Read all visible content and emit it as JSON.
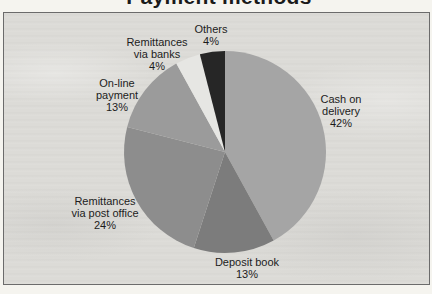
{
  "chart_data": {
    "type": "pie",
    "title": "Payment methods",
    "unit": "%",
    "direction": "clockwise",
    "start_angle": "12 o'clock",
    "legend": "none",
    "labels_layout": "outside slices, centered multi-line",
    "slices": [
      {
        "id": "cash-on-delivery",
        "label": "Cash on delivery",
        "value": 42,
        "percent_label": "42%",
        "label_lines": [
          "Cash on",
          "delivery",
          "42%"
        ],
        "color": "#a5a5a5",
        "label_pos": {
          "x": 341,
          "y": 93
        }
      },
      {
        "id": "deposit-book",
        "label": "Deposit book",
        "value": 13,
        "percent_label": "13%",
        "label_lines": [
          "Deposit book",
          "13%"
        ],
        "color": "#7c7c7c",
        "label_pos": {
          "x": 247,
          "y": 256
        }
      },
      {
        "id": "remittances-via-post-office",
        "label": "Remittances via post office",
        "value": 24,
        "percent_label": "24%",
        "label_lines": [
          "Remittances",
          "via post office",
          "24%"
        ],
        "color": "#8d8d8d",
        "label_pos": {
          "x": 105,
          "y": 195
        }
      },
      {
        "id": "on-line-payment",
        "label": "On-line payment",
        "value": 13,
        "percent_label": "13%",
        "label_lines": [
          "On-line",
          "payment",
          "13%"
        ],
        "color": "#9b9b9b",
        "label_pos": {
          "x": 117,
          "y": 77
        }
      },
      {
        "id": "remittances-via-banks",
        "label": "Remittances via banks",
        "value": 4,
        "percent_label": "4%",
        "label_lines": [
          "Remittances",
          "via banks",
          "4%"
        ],
        "color": "#e6e6e3",
        "label_pos": {
          "x": 157,
          "y": 36
        }
      },
      {
        "id": "others",
        "label": "Others",
        "value": 4,
        "percent_label": "4%",
        "label_lines": [
          "Others",
          "4%"
        ],
        "color": "#262626",
        "label_pos": {
          "x": 211,
          "y": 23
        }
      }
    ],
    "geometry": {
      "cx": 225,
      "cy": 152,
      "r": 101
    },
    "colors": {
      "page_bg": "#f5f4ef",
      "plot_area_bg": "#dcdbd7",
      "frame": "#6b6b6b",
      "label_text": "#1c1c1c",
      "title_text": "#1a1a1a"
    }
  }
}
